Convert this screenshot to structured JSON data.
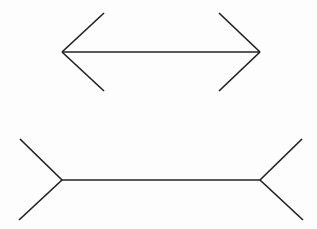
{
  "canvas": {
    "width": 317,
    "height": 229,
    "background_color": "#fdfdfd",
    "line_color": "#222222",
    "line_width": 1.7
  },
  "figures": [
    {
      "id": "top-figure",
      "name": "outward-fins-arrow",
      "description": "horizontal shaft with arrowheads pointing outward at both ends (fins point inward, <--->)",
      "shaft": {
        "x1": 62,
        "y1": 52,
        "x2": 260,
        "y2": 52
      },
      "fins": [
        {
          "name": "left-upper-fin",
          "x1": 62,
          "y1": 52,
          "x2": 104,
          "y2": 13
        },
        {
          "name": "left-lower-fin",
          "x1": 62,
          "y1": 52,
          "x2": 104,
          "y2": 91
        },
        {
          "name": "right-upper-fin",
          "x1": 260,
          "y1": 52,
          "x2": 219,
          "y2": 13
        },
        {
          "name": "right-lower-fin",
          "x1": 260,
          "y1": 52,
          "x2": 219,
          "y2": 91
        }
      ]
    },
    {
      "id": "bottom-figure",
      "name": "inward-fins-arrow",
      "description": "horizontal shaft with fins splaying outward at both ends (>---<)",
      "shaft": {
        "x1": 62,
        "y1": 180,
        "x2": 260,
        "y2": 180
      },
      "fins": [
        {
          "name": "left-upper-fin",
          "x1": 62,
          "y1": 180,
          "x2": 20,
          "y2": 139
        },
        {
          "name": "left-lower-fin",
          "x1": 62,
          "y1": 180,
          "x2": 19,
          "y2": 220
        },
        {
          "name": "right-upper-fin",
          "x1": 260,
          "y1": 180,
          "x2": 302,
          "y2": 139
        },
        {
          "name": "right-lower-fin",
          "x1": 260,
          "y1": 180,
          "x2": 303,
          "y2": 220
        }
      ]
    }
  ]
}
